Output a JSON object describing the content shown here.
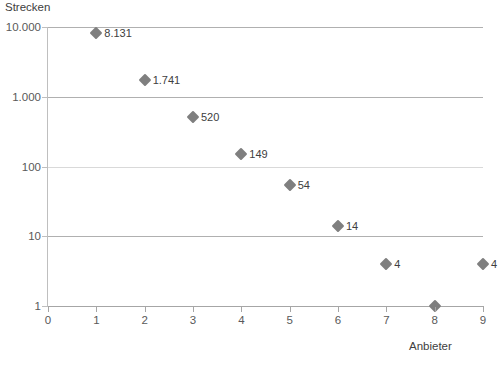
{
  "chart_data": {
    "type": "scatter",
    "title": "",
    "xlabel": "Anbieter",
    "ylabel": "Strecken",
    "yscale": "log",
    "ylim": [
      1,
      10000
    ],
    "xlim": [
      0,
      9
    ],
    "grid": true,
    "legend": "none",
    "x": [
      1,
      2,
      3,
      4,
      5,
      6,
      7,
      8,
      9
    ],
    "values": [
      8131,
      1741,
      520,
      149,
      54,
      14,
      4,
      1,
      4
    ],
    "point_labels": [
      "8.131",
      "1.741",
      "520",
      "149",
      "54",
      "14",
      "4",
      "",
      "4"
    ],
    "x_tick_labels": [
      "0",
      "1",
      "2",
      "3",
      "4",
      "5",
      "6",
      "7",
      "8",
      "9"
    ],
    "y_tick_labels": [
      "10.000",
      "1.000",
      "100",
      "10",
      "1"
    ],
    "y_tick_values": [
      10000,
      1000,
      100,
      10,
      1
    ],
    "marker_color": "#7f7f7f",
    "gridline_color": "#b0b0b0",
    "axis_color": "#a6a6a6"
  }
}
